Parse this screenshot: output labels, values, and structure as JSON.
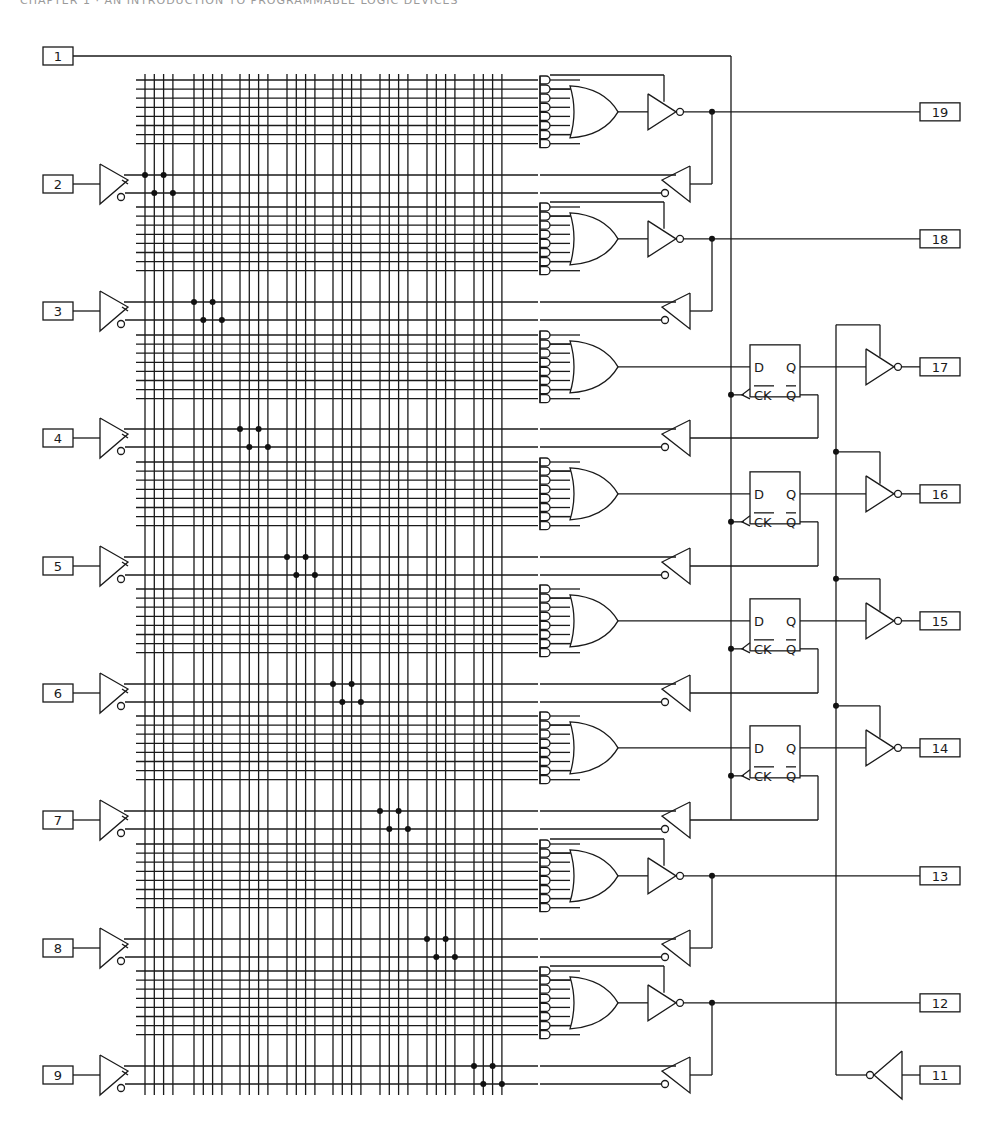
{
  "page": {
    "header_text": "CHAPTER 1 · AN INTRODUCTION TO PROGRAMMABLE LOGIC DEVICES"
  },
  "diagram": {
    "type": "PAL logic diagram (registered PAL, 20-pin)",
    "colors": {
      "line": "#1a1a1a",
      "background": "#ffffff"
    },
    "input_pins": [
      {
        "label": "1",
        "role": "clock"
      },
      {
        "label": "2"
      },
      {
        "label": "3"
      },
      {
        "label": "4"
      },
      {
        "label": "5"
      },
      {
        "label": "6"
      },
      {
        "label": "7"
      },
      {
        "label": "8"
      },
      {
        "label": "9"
      }
    ],
    "output_pins": [
      {
        "label": "19",
        "type": "combinational"
      },
      {
        "label": "18",
        "type": "combinational"
      },
      {
        "label": "17",
        "type": "registered"
      },
      {
        "label": "16",
        "type": "registered"
      },
      {
        "label": "15",
        "type": "registered"
      },
      {
        "label": "14",
        "type": "registered"
      },
      {
        "label": "13",
        "type": "combinational"
      },
      {
        "label": "12",
        "type": "combinational"
      }
    ],
    "enable_pin": {
      "label": "11"
    },
    "flip_flop_labels": {
      "d": "D",
      "q": "Q",
      "ck": "CK",
      "qbar": "Q"
    },
    "product_terms_per_or": 8,
    "or_gates": 8,
    "flip_flops": 4
  }
}
